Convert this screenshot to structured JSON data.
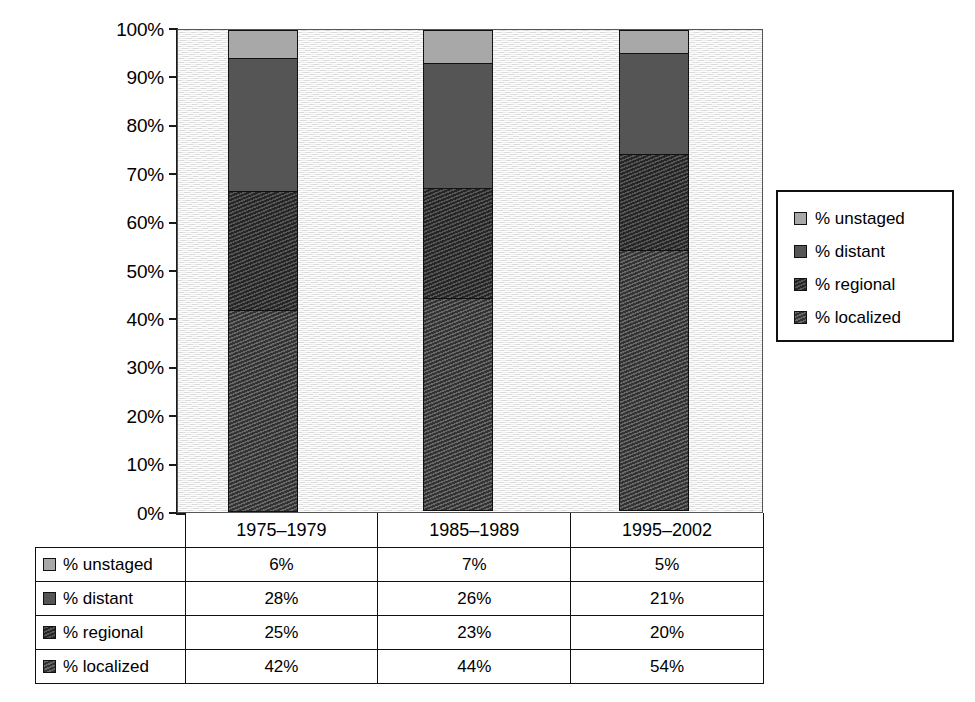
{
  "chart_data": {
    "type": "bar",
    "subtype": "100% stacked column",
    "title": "",
    "xlabel": "",
    "ylabel": "",
    "ylim": [
      0,
      100
    ],
    "ytick_labels": [
      "100%",
      "90%",
      "80%",
      "70%",
      "60%",
      "50%",
      "40%",
      "30%",
      "20%",
      "10%",
      "0%"
    ],
    "ytick_values": [
      100,
      90,
      80,
      70,
      60,
      50,
      40,
      30,
      20,
      10,
      0
    ],
    "grid": false,
    "legend_position": "right",
    "categories": [
      "1975–1979",
      "1985–1989",
      "1995–2002"
    ],
    "series": [
      {
        "name": "% unstaged",
        "values": [
          6,
          7,
          5
        ],
        "labels": [
          "6%",
          "7%",
          "5%"
        ],
        "color": "#a8a8a8",
        "pattern": "solid"
      },
      {
        "name": "% distant",
        "values": [
          28,
          26,
          21
        ],
        "labels": [
          "28%",
          "26%",
          "21%"
        ],
        "color": "#555555",
        "pattern": "solid"
      },
      {
        "name": "% regional",
        "values": [
          25,
          23,
          20
        ],
        "labels": [
          "25%",
          "23%",
          "20%"
        ],
        "color": "#262626",
        "pattern": "diagonal-hatch"
      },
      {
        "name": "% localized",
        "values": [
          42,
          44,
          54
        ],
        "labels": [
          "42%",
          "44%",
          "54%"
        ],
        "color": "#333333",
        "pattern": "diagonal-hatch"
      }
    ],
    "stack_order_top_to_bottom": [
      "% unstaged",
      "% distant",
      "% regional",
      "% localized"
    ]
  },
  "legend": {
    "items": [
      {
        "label": "% unstaged"
      },
      {
        "label": "% distant"
      },
      {
        "label": "% regional"
      },
      {
        "label": "% localized"
      }
    ]
  },
  "table": {
    "header": [
      "",
      "1975–1979",
      "1985–1989",
      "1995–2002"
    ],
    "rows": [
      {
        "label": "% unstaged",
        "cells": [
          "6%",
          "7%",
          "5%"
        ]
      },
      {
        "label": "% distant",
        "cells": [
          "28%",
          "26%",
          "21%"
        ]
      },
      {
        "label": "% regional",
        "cells": [
          "25%",
          "23%",
          "20%"
        ]
      },
      {
        "label": "% localized",
        "cells": [
          "42%",
          "44%",
          "54%"
        ]
      }
    ]
  },
  "colors": {
    "unstaged": "#a8a8a8",
    "distant": "#555555",
    "regional": "#262626",
    "localized": "#333333",
    "plot_background": "#eaeaea",
    "axis": "#1a1a1a"
  }
}
